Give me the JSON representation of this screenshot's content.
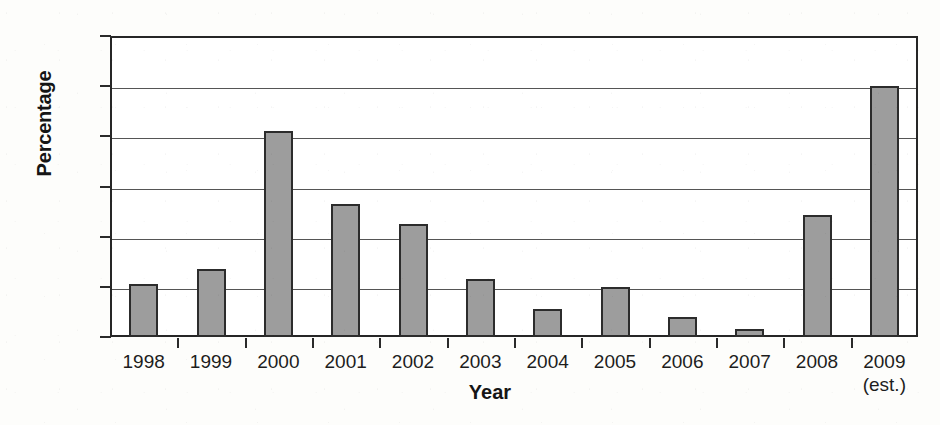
{
  "chart_data": {
    "type": "bar",
    "title": "",
    "xlabel": "Year",
    "ylabel": "Percentage",
    "categories": [
      "1998",
      "1999",
      "2000",
      "2001",
      "2002",
      "2003",
      "2004",
      "2005",
      "2006",
      "2007",
      "2008",
      "2009"
    ],
    "category_sublabels": [
      "",
      "",
      "",
      "",
      "",
      "",
      "",
      "",
      "",
      "",
      "",
      "(est.)"
    ],
    "values": [
      2.1,
      2.7,
      8.2,
      5.3,
      4.5,
      2.3,
      1.1,
      2.0,
      0.8,
      0.3,
      4.85,
      10.0
    ],
    "value_unit": "%",
    "ylim": [
      0,
      12
    ],
    "y_ticks": [
      0,
      2,
      4,
      6,
      8,
      10,
      12
    ],
    "y_tick_labels": [
      "0%",
      "2%",
      "4%",
      "6%",
      "8%",
      "10%",
      "12%"
    ],
    "grid": true,
    "grid_axis": "y",
    "legend": false,
    "legend_position": "none",
    "colors": {
      "bar_fill": "#9d9d9d",
      "bar_border": "#2c2c2c",
      "gridline": "#555555",
      "axis": "#262626",
      "text": "#1d1d1d",
      "background": "#ffffff"
    }
  }
}
